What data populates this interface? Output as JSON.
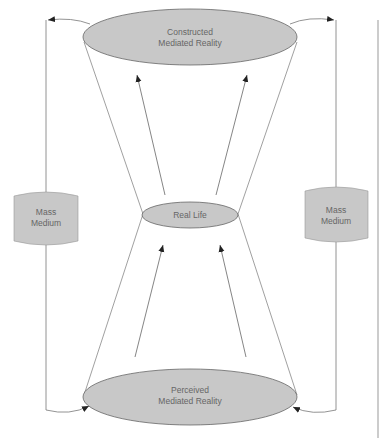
{
  "diagram": {
    "nodes": {
      "constructed": {
        "line1": "Constructed",
        "line2": "Mediated Reality"
      },
      "real_life": {
        "label": "Real Life"
      },
      "perceived": {
        "line1": "Perceived",
        "line2": "Mediated Reality"
      },
      "mass_medium_left": {
        "line1": "Mass",
        "line2": "Medium"
      },
      "mass_medium_right": {
        "line1": "Mass",
        "line2": "Medium"
      }
    },
    "colors": {
      "fill": "#c8c8c8",
      "stroke": "#555555",
      "line": "#777777",
      "text": "#666666"
    }
  }
}
